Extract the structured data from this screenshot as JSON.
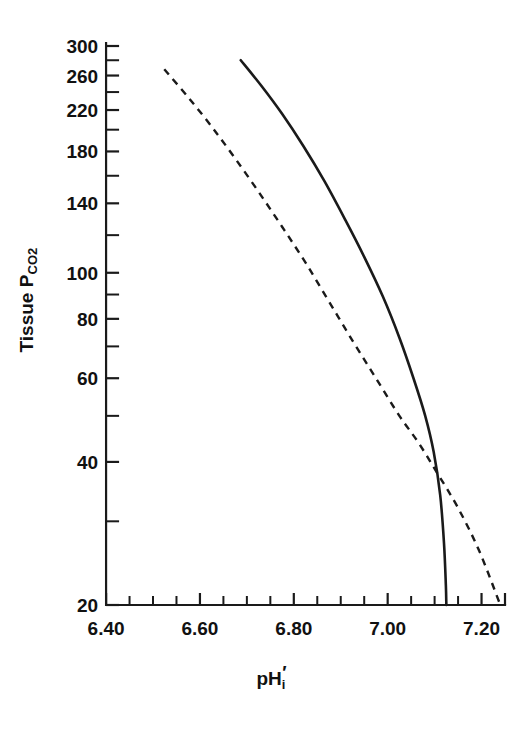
{
  "chart_data": {
    "type": "line",
    "title": "",
    "subtitle": "",
    "xlabel": "pH'i",
    "ylabel": "Tissue PCO2",
    "ylabel_main": "Tissue P",
    "ylabel_sub": "CO2",
    "xlabel_main": "pH",
    "xlabel_sub": "i",
    "xlabel_prime": "′",
    "yscale": "log",
    "xscale": "linear",
    "xlim": [
      6.37,
      7.25
    ],
    "ylim": [
      16.5,
      330
    ],
    "grid": false,
    "legend": "none",
    "x_ticks_major": [
      6.4,
      6.6,
      6.8,
      7.0,
      7.2
    ],
    "x_tick_labels": [
      "6.40",
      "6.60",
      "6.80",
      "7.00",
      "7.20"
    ],
    "x_ticks_minor": [
      6.5,
      6.7,
      6.9,
      7.1
    ],
    "y_ticks_major": [
      300,
      260,
      220,
      180,
      140,
      100,
      80,
      60,
      40,
      20
    ],
    "y_tick_labels": [
      "300",
      "260",
      "220",
      "180",
      "140",
      "100",
      "80",
      "60",
      "40",
      "20"
    ],
    "y_ticks_minor": [
      280,
      240,
      200,
      160,
      120,
      90,
      70,
      50,
      30
    ],
    "series": [
      {
        "name": "solid-curve",
        "style": "solid",
        "color": "#1a1a1a",
        "points": [
          [
            6.687,
            280
          ],
          [
            6.73,
            248
          ],
          [
            6.775,
            216
          ],
          [
            6.82,
            185
          ],
          [
            6.865,
            156
          ],
          [
            6.91,
            129
          ],
          [
            6.95,
            108
          ],
          [
            6.99,
            89
          ],
          [
            7.025,
            73
          ],
          [
            7.055,
            60
          ],
          [
            7.08,
            50
          ],
          [
            7.098,
            42
          ],
          [
            7.112,
            34
          ],
          [
            7.12,
            27
          ],
          [
            7.124,
            22
          ],
          [
            7.125,
            20
          ]
        ]
      },
      {
        "name": "dashed-curve",
        "style": "dashed",
        "color": "#1a1a1a",
        "points": [
          [
            6.524,
            268
          ],
          [
            6.575,
            234
          ],
          [
            6.625,
            203
          ],
          [
            6.675,
            174
          ],
          [
            6.725,
            148
          ],
          [
            6.775,
            125
          ],
          [
            6.825,
            105
          ],
          [
            6.875,
            87
          ],
          [
            6.925,
            72
          ],
          [
            6.975,
            60
          ],
          [
            7.025,
            50
          ],
          [
            7.065,
            44
          ],
          [
            7.105,
            38
          ],
          [
            7.15,
            32
          ],
          [
            7.195,
            26
          ],
          [
            7.24,
            20
          ]
        ]
      }
    ],
    "annotations": []
  }
}
